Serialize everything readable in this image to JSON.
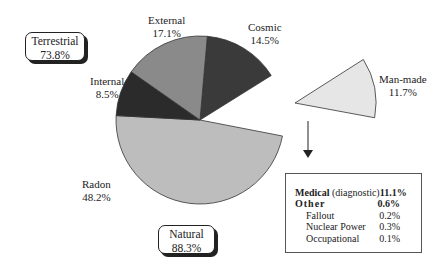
{
  "chart_data": {
    "type": "pie",
    "title": "",
    "center": [
      200,
      120
    ],
    "radius": 84,
    "slices": [
      {
        "name": "Cosmic",
        "value": 14.5,
        "label": "14.5%",
        "start_deg": -85,
        "end_deg": -32,
        "color": "#3a3a3a",
        "group": "Natural"
      },
      {
        "name": "Man-made",
        "value": 11.7,
        "label": "11.7%",
        "start_deg": -32,
        "end_deg": 11,
        "color": "#e6e6e6",
        "group": "Man-made",
        "exploded": true
      },
      {
        "name": "Radon",
        "value": 48.2,
        "label": "48.2%",
        "start_deg": 11,
        "end_deg": 183,
        "color": "#bdbdbd",
        "group": "Natural"
      },
      {
        "name": "Internal",
        "value": 8.5,
        "label": "8.5%",
        "start_deg": 183,
        "end_deg": 215,
        "color": "#2b2b2b",
        "group": "Natural"
      },
      {
        "name": "External",
        "value": 17.1,
        "label": "17.1%",
        "start_deg": 215,
        "end_deg": 275,
        "color": "#8a8a8a",
        "group": "Natural"
      }
    ],
    "groups": [
      {
        "name": "Terrestrial",
        "value": 73.8,
        "label": "73.8%"
      },
      {
        "name": "Natural",
        "value": 88.3,
        "label": "88.3%"
      }
    ],
    "man_made_breakdown": [
      {
        "name": "Medical",
        "qualifier": "(diagnostic)",
        "value": 11.1,
        "label": "11.1%",
        "level": 0
      },
      {
        "name": "Other",
        "value": 0.6,
        "label": "0.6%",
        "level": 0
      },
      {
        "name": "Fallout",
        "value": 0.2,
        "label": "0.2%",
        "level": 1
      },
      {
        "name": "Nuclear Power",
        "value": 0.3,
        "label": "0.3%",
        "level": 1
      },
      {
        "name": "Occupational",
        "value": 0.1,
        "label": "0.1%",
        "level": 1
      }
    ],
    "legend_position": "bottom-right"
  },
  "labels": {
    "external": {
      "name": "External",
      "pct": "17.1%"
    },
    "cosmic": {
      "name": "Cosmic",
      "pct": "14.5%"
    },
    "internal": {
      "name": "Internal",
      "pct": "8.5%"
    },
    "radon": {
      "name": "Radon",
      "pct": "48.2%"
    },
    "manmade": {
      "name": "Man-made",
      "pct": "11.7%"
    },
    "terrestrial": {
      "name": "Terrestrial",
      "pct": "73.8%"
    },
    "natural": {
      "name": "Natural",
      "pct": "88.3%"
    }
  },
  "legend": {
    "medical": {
      "name": "Medical",
      "qualifier": "(diagnostic)",
      "pct": "11.1%"
    },
    "other": {
      "name": "Other",
      "pct": "0.6%"
    },
    "fallout": {
      "name": "Fallout",
      "pct": "0.2%"
    },
    "nuclear": {
      "name": "Nuclear Power",
      "pct": "0.3%"
    },
    "occupational": {
      "name": "Occupational",
      "pct": "0.1%"
    }
  }
}
